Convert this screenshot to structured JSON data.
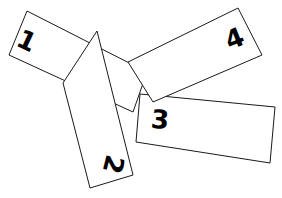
{
  "canvas": {
    "width": 282,
    "height": 198,
    "background_color": "#ffffff",
    "stroke_color": "#1a1a1a",
    "label_color": "#000000",
    "stroke_width": 1
  },
  "shapes": [
    {
      "label": "1",
      "name": "rectangle-1",
      "points": "27,11 147,72 133,112 9,55",
      "label_x": 26,
      "label_y": 42,
      "label_rotation": 25,
      "label_size": 26
    },
    {
      "label": "2",
      "name": "rectangle-2",
      "points": "63,83 97,31 133,175 90,188",
      "label_x": 112,
      "label_y": 164,
      "label_rotation": 104,
      "label_size": 26
    },
    {
      "label": "3",
      "name": "rectangle-3",
      "points": "140,94 275,107 270,163 136,142",
      "label_x": 160,
      "label_y": 121,
      "label_rotation": 5,
      "label_size": 26
    },
    {
      "label": "4",
      "name": "rectangle-4",
      "points": "238,8 262,55 153,102 128,62",
      "label_x": 235,
      "label_y": 40,
      "label_rotation": -22,
      "label_size": 26
    }
  ]
}
